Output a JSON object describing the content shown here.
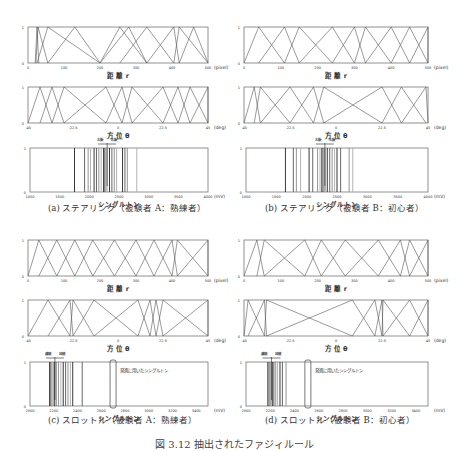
{
  "figure_caption": "図 3.12 抽出されたファジィルール",
  "panels": [
    {
      "id": "a",
      "caption": "(a) ステアリング（被験者 A：熟練者）"
    },
    {
      "id": "b",
      "caption": "(b) ステアリング（被験者 B：初心者）"
    },
    {
      "id": "c",
      "caption": "(c) スロットル（被験者 A：熟練者）"
    },
    {
      "id": "d",
      "caption": "(d) スロットル（被験者 B：初心者）"
    }
  ],
  "chart_data": [
    {
      "panel": "a",
      "type": "line",
      "title": "距離 r",
      "xlabel": "距 離 r",
      "unit": "(pixel)",
      "xlim": [
        0,
        500
      ],
      "ylim": [
        0,
        1
      ],
      "xticks": [
        0,
        100,
        200,
        300,
        400,
        500
      ],
      "yticks": [
        0,
        1
      ],
      "triangles": [
        [
          20,
          25,
          30
        ],
        [
          22,
          28,
          55
        ],
        [
          25,
          55,
          200
        ],
        [
          55,
          130,
          200
        ],
        [
          200,
          255,
          330
        ],
        [
          200,
          280,
          330
        ],
        [
          255,
          330,
          405
        ],
        [
          330,
          405,
          420
        ],
        [
          405,
          420,
          500
        ],
        [
          420,
          460,
          500
        ]
      ]
    },
    {
      "panel": "a",
      "type": "line",
      "title": "方位 θ",
      "xlabel": "方 位 θ",
      "unit": "(deg)",
      "xlim": [
        -45,
        45
      ],
      "ylim": [
        0,
        1
      ],
      "xticks": [
        -45,
        -22.5,
        0,
        22.5,
        45
      ],
      "xticklabels": [
        "-45",
        "-22.5",
        "0",
        "22.5",
        "45"
      ],
      "yticks": [
        0,
        1
      ],
      "triangles": [
        [
          -45,
          -39,
          -33
        ],
        [
          -39,
          -33,
          -27
        ],
        [
          -33,
          -27,
          -6
        ],
        [
          -27,
          -6,
          2
        ],
        [
          -6,
          2,
          7
        ],
        [
          2,
          7,
          22.5
        ],
        [
          7,
          22.5,
          30
        ],
        [
          22.5,
          30,
          36
        ],
        [
          30,
          36,
          45
        ],
        [
          36,
          45,
          45
        ]
      ]
    },
    {
      "panel": "a",
      "type": "singleton",
      "title": "シングルトン",
      "xlabel": "シングルトン",
      "unit": "(mV)",
      "xlim": [
        1000,
        4000
      ],
      "ylim": [
        0,
        1
      ],
      "xticks": [
        1000,
        1500,
        2000,
        2500,
        3000,
        3500,
        4000
      ],
      "yticks": [
        0,
        1
      ],
      "singletons": [
        1750,
        1920,
        1980,
        2020,
        2080,
        2120,
        2160,
        2200,
        2240,
        2260,
        2280,
        2300,
        2340,
        2380,
        2420,
        2460,
        2560,
        2600,
        2640,
        2800
      ],
      "annotation": {
        "left": "左旋",
        "right": "右旋",
        "center": 2300
      }
    },
    {
      "panel": "b",
      "type": "line",
      "title": "距離 r",
      "xlabel": "距 離 r",
      "unit": "(pixel)",
      "xlim": [
        0,
        500
      ],
      "ylim": [
        0,
        1
      ],
      "xticks": [
        0,
        100,
        200,
        300,
        400,
        500
      ],
      "yticks": [
        0,
        1
      ],
      "triangles": [
        [
          0,
          40,
          110
        ],
        [
          40,
          110,
          150
        ],
        [
          110,
          150,
          240
        ],
        [
          150,
          240,
          300
        ],
        [
          240,
          300,
          330
        ],
        [
          300,
          330,
          400
        ],
        [
          330,
          400,
          450
        ],
        [
          400,
          450,
          500
        ],
        [
          450,
          500,
          500
        ]
      ]
    },
    {
      "panel": "b",
      "type": "line",
      "title": "方位 θ",
      "xlabel": "方 位 θ",
      "unit": "(deg)",
      "xlim": [
        -45,
        45
      ],
      "ylim": [
        0,
        1
      ],
      "xticks": [
        -45,
        -22.5,
        0,
        22.5,
        45
      ],
      "xticklabels": [
        "-45",
        "-22.5",
        "0",
        "22.5",
        "45"
      ],
      "yticks": [
        0,
        1
      ],
      "triangles": [
        [
          -45,
          -40,
          -37
        ],
        [
          -40,
          -37,
          -22.5
        ],
        [
          -37,
          -22.5,
          -11
        ],
        [
          -22.5,
          -11,
          -6
        ],
        [
          -11,
          -6,
          22.5
        ],
        [
          -6,
          22.5,
          32
        ],
        [
          22.5,
          32,
          44
        ],
        [
          32,
          44,
          45
        ]
      ]
    },
    {
      "panel": "b",
      "type": "singleton",
      "title": "シングルトン",
      "xlabel": "シングルトン",
      "unit": "(mV)",
      "xlim": [
        1000,
        4000
      ],
      "ylim": [
        0,
        1
      ],
      "xticks": [
        1000,
        1500,
        2000,
        2500,
        3000,
        3500,
        4000
      ],
      "yticks": [
        0,
        1
      ],
      "singletons": [
        1650,
        1780,
        1830,
        1900,
        2040,
        2100,
        2180,
        2220,
        2250,
        2270,
        2290,
        2310,
        2340,
        2380,
        2420,
        2460,
        2500,
        2560,
        2700,
        2760
      ],
      "annotation": {
        "left": "左旋",
        "right": "右旋",
        "center": 2300
      }
    },
    {
      "panel": "c",
      "type": "line",
      "title": "距離 r",
      "xlabel": "距 離 r",
      "unit": "(pixel)",
      "xlim": [
        0,
        500
      ],
      "ylim": [
        0,
        1
      ],
      "xticks": [
        0,
        100,
        200,
        300,
        400,
        500
      ],
      "yticks": [
        0,
        1
      ],
      "triangles": [
        [
          0,
          30,
          80
        ],
        [
          30,
          80,
          130
        ],
        [
          80,
          130,
          180
        ],
        [
          130,
          180,
          240
        ],
        [
          180,
          240,
          300
        ],
        [
          240,
          300,
          350
        ],
        [
          300,
          350,
          400
        ],
        [
          350,
          400,
          415
        ],
        [
          400,
          415,
          500
        ],
        [
          415,
          500,
          500
        ]
      ]
    },
    {
      "panel": "c",
      "type": "line",
      "title": "方位 θ",
      "xlabel": "方 位 θ",
      "unit": "(deg)",
      "xlim": [
        -45,
        45
      ],
      "ylim": [
        0,
        1
      ],
      "xticks": [
        -45,
        -22.5,
        0,
        22.5,
        45
      ],
      "xticklabels": [
        "-45",
        "-22.5",
        "0",
        "22.5",
        "45"
      ],
      "yticks": [
        0,
        1
      ],
      "triangles": [
        [
          -45,
          -35,
          -24
        ],
        [
          -35,
          -24,
          -22.5
        ],
        [
          -24,
          -22.5,
          -12
        ],
        [
          -22.5,
          -12,
          10
        ],
        [
          -12,
          10,
          16
        ],
        [
          10,
          16,
          19
        ],
        [
          16,
          19,
          22.5
        ],
        [
          19,
          22.5,
          45
        ],
        [
          22.5,
          45,
          45
        ]
      ]
    },
    {
      "panel": "c",
      "type": "singleton",
      "title": "シングルトン",
      "xlabel": "シングルトン",
      "unit": "(mV)",
      "xlim": [
        2000,
        3500
      ],
      "ylim": [
        0,
        1
      ],
      "xticks": [
        2000,
        2200,
        2400,
        2600,
        2800,
        3000,
        3200,
        3400
      ],
      "yticks": [
        0,
        1
      ],
      "singletons": [
        2165,
        2175,
        2185,
        2195,
        2205,
        2220,
        2240,
        2260,
        2280,
        2300,
        2320,
        2340,
        2360,
        2440
      ],
      "annotation": {
        "left": "減速",
        "right": "加速",
        "center": 2210
      },
      "highlight": {
        "value": 2700,
        "label": "発進に用いたシングルトン"
      }
    },
    {
      "panel": "d",
      "type": "line",
      "title": "距離 r",
      "xlabel": "距 離 r",
      "unit": "(pixel)",
      "xlim": [
        0,
        500
      ],
      "ylim": [
        0,
        1
      ],
      "xticks": [
        0,
        100,
        200,
        300,
        400,
        500
      ],
      "yticks": [
        0,
        1
      ],
      "triangles": [
        [
          0,
          35,
          55
        ],
        [
          35,
          55,
          165
        ],
        [
          55,
          165,
          210
        ],
        [
          165,
          210,
          275
        ],
        [
          210,
          275,
          365
        ],
        [
          275,
          365,
          425
        ],
        [
          365,
          425,
          450
        ],
        [
          425,
          450,
          500
        ],
        [
          450,
          500,
          500
        ]
      ]
    },
    {
      "panel": "d",
      "type": "line",
      "title": "方位 θ",
      "xlabel": "方 位 θ",
      "unit": "(deg)",
      "xlim": [
        -45,
        45
      ],
      "ylim": [
        0,
        1
      ],
      "xticks": [
        -45,
        -22.5,
        0,
        22.5,
        45
      ],
      "xticklabels": [
        "-45",
        "-22.5",
        "0",
        "22.5",
        "45"
      ],
      "yticks": [
        0,
        1
      ],
      "triangles": [
        [
          -45,
          -43,
          -35
        ],
        [
          -43,
          -35,
          -34
        ],
        [
          -35,
          -34,
          8
        ],
        [
          -34,
          8,
          19
        ],
        [
          8,
          19,
          22.5
        ],
        [
          19,
          22.5,
          23
        ],
        [
          22.5,
          23,
          36
        ],
        [
          23,
          36,
          45
        ],
        [
          36,
          45,
          45
        ]
      ]
    },
    {
      "panel": "d",
      "type": "singleton",
      "title": "シングルトン",
      "xlabel": "シングルトン",
      "unit": "(mV)",
      "xlim": [
        2000,
        3500
      ],
      "ylim": [
        0,
        1
      ],
      "xticks": [
        2000,
        2200,
        2400,
        2600,
        2800,
        3000,
        3200,
        3400
      ],
      "yticks": [
        0,
        1
      ],
      "singletons": [
        2180,
        2190,
        2200,
        2210,
        2220,
        2230,
        2245,
        2260,
        2280,
        2300,
        2330
      ],
      "annotation": {
        "left": "減速",
        "right": "加速",
        "center": 2210
      },
      "highlight": {
        "value": 2510,
        "label": "発進に用いたシングルトン"
      }
    }
  ]
}
